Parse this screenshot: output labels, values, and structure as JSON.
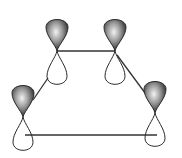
{
  "diagram": {
    "orbital_count": 4,
    "orbitals": [
      {
        "id": "p1",
        "top_lobe": "shaded",
        "bottom_lobe": "unshaded"
      },
      {
        "id": "p2",
        "top_lobe": "shaded",
        "bottom_lobe": "unshaded"
      },
      {
        "id": "p3",
        "top_lobe": "shaded",
        "bottom_lobe": "unshaded"
      },
      {
        "id": "p4",
        "top_lobe": "shaded",
        "bottom_lobe": "unshaded"
      }
    ],
    "bonds": [
      {
        "from": "p1",
        "to": "p2"
      },
      {
        "from": "p2",
        "to": "p4"
      },
      {
        "from": "p1",
        "to": "p3"
      },
      {
        "from": "p3",
        "to": "p4"
      }
    ],
    "colors": {
      "shaded_lobe_dark": "#1a1a1a",
      "shaded_lobe_light": "#f2f2f2",
      "outline": "#2a2a2a",
      "bond": "#333333"
    }
  }
}
